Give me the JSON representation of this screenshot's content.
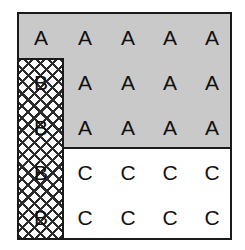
{
  "diagram": {
    "type": "block-matrix",
    "title": "",
    "rows": 5,
    "columns": 5,
    "colors": {
      "shaded_fill": "#c9c9c9",
      "plain_fill": "#ffffff",
      "hatch_stroke": "#2b2b2b",
      "border": "#1a1a1a",
      "text": "#111111"
    },
    "regions": [
      {
        "name": "shaded-a-region",
        "fill": "shaded",
        "label": "A"
      },
      {
        "name": "hatched-b-column",
        "fill": "crosshatch",
        "label": "B"
      },
      {
        "name": "plain-c-region",
        "fill": "plain",
        "label": "C"
      }
    ],
    "cells": [
      {
        "row": 1,
        "col": 1,
        "label": "A",
        "fill": "shaded"
      },
      {
        "row": 1,
        "col": 2,
        "label": "A",
        "fill": "shaded"
      },
      {
        "row": 1,
        "col": 3,
        "label": "A",
        "fill": "shaded"
      },
      {
        "row": 1,
        "col": 4,
        "label": "A",
        "fill": "shaded"
      },
      {
        "row": 1,
        "col": 5,
        "label": "A",
        "fill": "shaded"
      },
      {
        "row": 2,
        "col": 1,
        "label": "B",
        "fill": "crosshatch"
      },
      {
        "row": 2,
        "col": 2,
        "label": "A",
        "fill": "shaded"
      },
      {
        "row": 2,
        "col": 3,
        "label": "A",
        "fill": "shaded"
      },
      {
        "row": 2,
        "col": 4,
        "label": "A",
        "fill": "shaded"
      },
      {
        "row": 2,
        "col": 5,
        "label": "A",
        "fill": "shaded"
      },
      {
        "row": 3,
        "col": 1,
        "label": "B",
        "fill": "crosshatch"
      },
      {
        "row": 3,
        "col": 2,
        "label": "A",
        "fill": "shaded"
      },
      {
        "row": 3,
        "col": 3,
        "label": "A",
        "fill": "shaded"
      },
      {
        "row": 3,
        "col": 4,
        "label": "A",
        "fill": "shaded"
      },
      {
        "row": 3,
        "col": 5,
        "label": "A",
        "fill": "shaded"
      },
      {
        "row": 4,
        "col": 1,
        "label": "B",
        "fill": "crosshatch"
      },
      {
        "row": 4,
        "col": 2,
        "label": "C",
        "fill": "plain"
      },
      {
        "row": 4,
        "col": 3,
        "label": "C",
        "fill": "plain"
      },
      {
        "row": 4,
        "col": 4,
        "label": "C",
        "fill": "plain"
      },
      {
        "row": 4,
        "col": 5,
        "label": "C",
        "fill": "plain"
      },
      {
        "row": 5,
        "col": 1,
        "label": "B",
        "fill": "crosshatch"
      },
      {
        "row": 5,
        "col": 2,
        "label": "C",
        "fill": "plain"
      },
      {
        "row": 5,
        "col": 3,
        "label": "C",
        "fill": "plain"
      },
      {
        "row": 5,
        "col": 4,
        "label": "C",
        "fill": "plain"
      },
      {
        "row": 5,
        "col": 5,
        "label": "C",
        "fill": "plain"
      }
    ]
  }
}
